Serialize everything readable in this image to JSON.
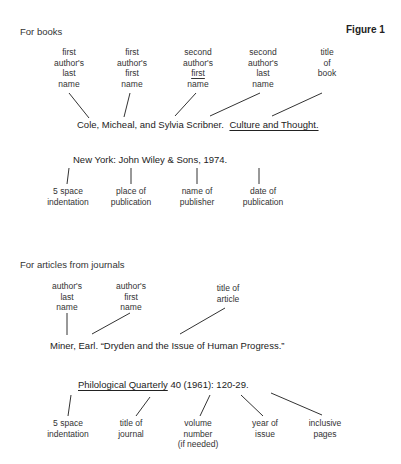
{
  "figure_label": "Figure 1",
  "books": {
    "section_title": "For books",
    "top_labels": [
      {
        "lines": [
          "first",
          "author's",
          "last",
          "name"
        ],
        "underline_line": null
      },
      {
        "lines": [
          "first",
          "author's",
          "first",
          "name"
        ],
        "underline_line": null
      },
      {
        "lines": [
          "second",
          "author's",
          "first",
          "name"
        ],
        "underline_line": 2
      },
      {
        "lines": [
          "second",
          "author's",
          "last",
          "name"
        ],
        "underline_line": null
      },
      {
        "lines": [
          "title",
          "of",
          "book"
        ],
        "underline_line": null
      }
    ],
    "citation_line1": {
      "authors": "Cole, Micheal, and Sylvia Scribner.",
      "title": "Culture and Thought."
    },
    "citation_line2": "New York: John Wiley & Sons, 1974.",
    "bottom_labels": [
      {
        "lines": [
          "5 space",
          "indentation"
        ]
      },
      {
        "lines": [
          "place of",
          "publication"
        ]
      },
      {
        "lines": [
          "name of",
          "publisher"
        ]
      },
      {
        "lines": [
          "date of",
          "publication"
        ]
      }
    ]
  },
  "journals": {
    "section_title": "For articles from journals",
    "top_labels": [
      {
        "lines": [
          "author's",
          "last",
          "name"
        ]
      },
      {
        "lines": [
          "author's",
          "first",
          "name"
        ]
      },
      {
        "lines": [
          "title of",
          "article"
        ]
      }
    ],
    "citation_line1": "Miner, Earl. “Dryden and the Issue of Human Progress.”",
    "citation_line2": {
      "journal": "Philological Quarterly",
      "rest": " 40 (1961): 120-29."
    },
    "bottom_labels": [
      {
        "lines": [
          "5 space",
          "indentation"
        ]
      },
      {
        "lines": [
          "title of",
          "journal"
        ]
      },
      {
        "lines": [
          "volume",
          "number",
          "(if needed)"
        ]
      },
      {
        "lines": [
          "year of",
          "issue"
        ]
      },
      {
        "lines": [
          "inclusive",
          "pages"
        ]
      }
    ]
  }
}
